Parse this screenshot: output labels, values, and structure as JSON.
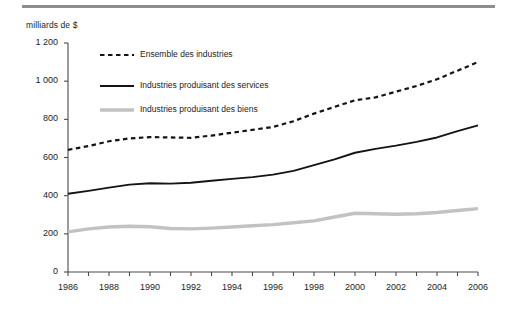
{
  "figure": {
    "axis_title": "milliards de $",
    "accent_rule_color": "#8d8d8d"
  },
  "legend": {
    "position": "top-center-inside",
    "items": [
      {
        "label": "Ensemble des industries",
        "style": "dashed",
        "color": "#141414"
      },
      {
        "label": "Industries produisant des services",
        "style": "solid",
        "color": "#141414"
      },
      {
        "label": "Industries produisant des biens",
        "style": "solid-thick",
        "color": "#c2c2c2"
      }
    ]
  },
  "chart_data": {
    "type": "line",
    "title": "",
    "subtitle": "",
    "xlabel": "",
    "ylabel": "milliards de $",
    "ylim": [
      0,
      1200
    ],
    "ytick_step": 200,
    "ytick_labels": [
      "0",
      "200",
      "400",
      "600",
      "800",
      "1 000",
      "1 200"
    ],
    "ytick_values": [
      0,
      200,
      400,
      600,
      800,
      1000,
      1200
    ],
    "xlim": [
      1986,
      2006
    ],
    "grid": false,
    "x": [
      1986,
      1987,
      1988,
      1989,
      1990,
      1991,
      1992,
      1993,
      1994,
      1995,
      1996,
      1997,
      1998,
      1999,
      2000,
      2001,
      2002,
      2003,
      2004,
      2005,
      2006
    ],
    "xtick_labels": [
      "1986",
      "1988",
      "1990",
      "1992",
      "1994",
      "1996",
      "1998",
      "2000",
      "2002",
      "2004",
      "2006"
    ],
    "xtick_label_values": [
      1986,
      1988,
      1990,
      1992,
      1994,
      1996,
      1998,
      2000,
      2002,
      2004,
      2006
    ],
    "series": [
      {
        "name": "Ensemble des industries",
        "style": "dashed",
        "color": "#141414",
        "values": [
          640,
          660,
          685,
          700,
          707,
          705,
          703,
          715,
          730,
          745,
          760,
          790,
          830,
          865,
          900,
          915,
          945,
          975,
          1010,
          1055,
          1100
        ]
      },
      {
        "name": "Industries produisant des services",
        "style": "solid",
        "color": "#141414",
        "values": [
          410,
          425,
          442,
          458,
          465,
          463,
          468,
          478,
          488,
          497,
          510,
          530,
          560,
          590,
          625,
          645,
          662,
          682,
          705,
          738,
          768
        ]
      },
      {
        "name": "Industries produisant des biens",
        "style": "solid-thick",
        "color": "#c2c2c2",
        "values": [
          210,
          226,
          236,
          240,
          237,
          228,
          226,
          230,
          236,
          242,
          248,
          258,
          268,
          288,
          308,
          305,
          303,
          305,
          312,
          322,
          332
        ]
      }
    ]
  }
}
